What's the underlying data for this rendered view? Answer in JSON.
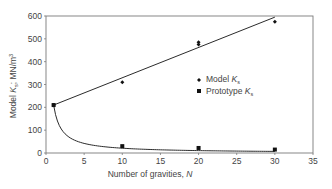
{
  "chart_data": {
    "type": "scatter",
    "title": "",
    "xlabel": "Number of gravities, N",
    "ylabel": "Model K_s; MN/m^3",
    "xlim": [
      0,
      35
    ],
    "ylim": [
      0,
      600
    ],
    "xticks": [
      0,
      5,
      10,
      15,
      20,
      25,
      30,
      35
    ],
    "yticks": [
      0,
      100,
      200,
      300,
      400,
      500,
      600
    ],
    "grid": false,
    "legend_position": "inside-right-middle",
    "series": [
      {
        "name": "Model K_s",
        "marker": "diamond",
        "points": [
          [
            1,
            210
          ],
          [
            10,
            310
          ],
          [
            20,
            475
          ],
          [
            20,
            485
          ],
          [
            30,
            575
          ]
        ],
        "fit": "linear",
        "fit_line": [
          [
            1,
            210
          ],
          [
            30,
            595
          ]
        ]
      },
      {
        "name": "Prototype K_s",
        "marker": "square",
        "points": [
          [
            1,
            210
          ],
          [
            10,
            30
          ],
          [
            20,
            22
          ],
          [
            30,
            15
          ]
        ],
        "fit": "inverse (K = 210/N)",
        "fit_curve_coeff": 210
      }
    ]
  },
  "axes": {
    "xlabel_main": "Number of gravities, ",
    "xlabel_var": "N",
    "ylabel_prefix": "Model ",
    "ylabel_var": "K",
    "ylabel_sub": "s",
    "ylabel_unit": "; MN/m",
    "ylabel_exp": "3"
  },
  "legend": {
    "items": [
      {
        "label": "Model ",
        "var": "K",
        "sub": "s"
      },
      {
        "label": "Prototype ",
        "var": "K",
        "sub": "s"
      }
    ]
  },
  "colors": {
    "axis": "#7a7a7a",
    "line": "#2b2b2b",
    "marker": "#111111",
    "text": "#444444"
  }
}
